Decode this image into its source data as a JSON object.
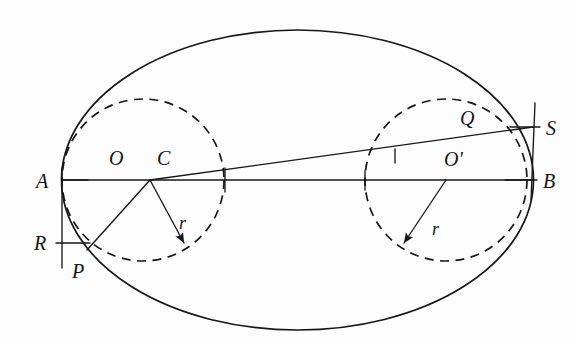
{
  "figure": {
    "background_color": "#fdfdfd",
    "ink_color": "#17171a"
  },
  "labels": {
    "a": "A",
    "b": "B",
    "o": "O",
    "o_prime": "O'",
    "c": "C",
    "p": "P",
    "q": "Q",
    "r_point": "R",
    "s": "S",
    "radius_left": "r",
    "radius_right": "r"
  },
  "geometry": {
    "ellipse": {
      "center_x": 297.5,
      "center_y": 180,
      "semi_major": 236,
      "semi_minor": 150
    },
    "major_axis": {
      "x1": 62,
      "y1": 180,
      "x2": 533,
      "y2": 180
    },
    "circle_left": {
      "center_x": 143,
      "center_y": 180,
      "radius": 81,
      "style": "dashed"
    },
    "circle_right": {
      "center_x": 446,
      "center_y": 180,
      "radius": 81,
      "style": "dashed"
    },
    "chord_p_c_s": {
      "x1": 87,
      "y1": 250,
      "x2": 150,
      "y2": 180,
      "x3": 533,
      "y3": 127
    },
    "radius_arrow_left": {
      "from_x": 150,
      "from_y": 180,
      "to_x": 184,
      "to_y": 243
    },
    "radius_arrow_right": {
      "from_x": 446,
      "from_y": 180,
      "to_x": 404,
      "to_y": 243
    },
    "vertical_left": {
      "x": 62,
      "y_top": 168,
      "y_bottom": 268
    },
    "vertical_right": {
      "x": 533,
      "y_top": 103,
      "y_bottom": 200
    },
    "tick_a": {
      "x1": 62,
      "y1": 180,
      "x2": 88,
      "y2": 180
    },
    "tick_r": {
      "x1": 56,
      "y1": 243,
      "x2": 90,
      "y2": 243
    },
    "tick_s": {
      "x1": 510,
      "y1": 127,
      "x2": 540,
      "y2": 127
    },
    "tick_b": {
      "x1": 505,
      "y1": 180,
      "x2": 537,
      "y2": 180
    },
    "axis_tick_left": {
      "x": 225,
      "y_top": 168,
      "y_bottom": 192
    },
    "axis_tick_right": {
      "x": 365,
      "y_top": 171,
      "y_bottom": 190
    },
    "chord_tick": {
      "x": 395,
      "y_top": 149,
      "y_bottom": 163
    }
  },
  "label_positions": {
    "a": {
      "x": 36,
      "y": 188
    },
    "b": {
      "x": 543,
      "y": 188
    },
    "o": {
      "x": 109,
      "y": 165
    },
    "o_prime": {
      "x": 444,
      "y": 166
    },
    "c": {
      "x": 157,
      "y": 165
    },
    "p": {
      "x": 72,
      "y": 278
    },
    "q": {
      "x": 460,
      "y": 125
    },
    "r_point": {
      "x": 34,
      "y": 250
    },
    "s": {
      "x": 546,
      "y": 135
    },
    "radius_left": {
      "x": 179,
      "y": 229
    },
    "radius_right": {
      "x": 432,
      "y": 235
    }
  }
}
